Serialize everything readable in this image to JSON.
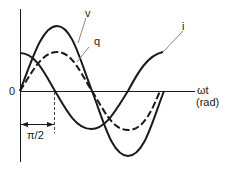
{
  "diagram": {
    "title": "",
    "axes": {
      "origin_label": "0",
      "x_label_line1": "ωt",
      "x_label_line2": "(rad)"
    },
    "curves": [
      {
        "name": "v",
        "label": "v",
        "style": "solid",
        "description": "voltage, sine"
      },
      {
        "name": "q",
        "label": "q",
        "style": "dashed",
        "description": "charge, in phase with v, smaller amplitude"
      },
      {
        "name": "i",
        "label": "i",
        "style": "solid",
        "description": "current, leads v by π/2 (cosine)"
      }
    ],
    "annotation": {
      "phase_shift_label": "π/2"
    },
    "colors": {
      "line": "#1a1a1a",
      "leader": "#888888",
      "background": "#ffffff"
    }
  }
}
